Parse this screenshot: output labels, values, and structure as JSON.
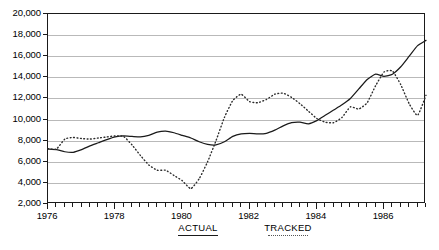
{
  "chart_data": {
    "type": "line",
    "title": "",
    "xlabel": "",
    "ylabel": "",
    "xlim": [
      1976,
      1987.25
    ],
    "ylim": [
      2000,
      20000
    ],
    "grid": true,
    "legend_position": "bottom",
    "y_ticks": [
      2000,
      4000,
      6000,
      8000,
      10000,
      12000,
      14000,
      16000,
      18000,
      20000
    ],
    "y_tick_labels": [
      "2,000",
      "4,000",
      "6,000",
      "8,000",
      "10,000",
      "12,000",
      "14,000",
      "16,000",
      "18,000",
      "20,000"
    ],
    "x_ticks": [
      1976,
      1978,
      1980,
      1982,
      1984,
      1986
    ],
    "x_tick_labels": [
      "1976",
      "1978",
      "1980",
      "1982",
      "1984",
      "1986"
    ],
    "x_minor_tick_interval": 0.25,
    "series": [
      {
        "name": "ACTUAL",
        "style": "solid",
        "color": "#1a1a1a",
        "x": [
          1976.0,
          1976.25,
          1976.5,
          1976.75,
          1977.0,
          1977.25,
          1977.5,
          1977.75,
          1978.0,
          1978.25,
          1978.5,
          1978.75,
          1979.0,
          1979.25,
          1979.5,
          1979.75,
          1980.0,
          1980.25,
          1980.5,
          1980.75,
          1981.0,
          1981.25,
          1981.5,
          1981.75,
          1982.0,
          1982.25,
          1982.5,
          1982.75,
          1983.0,
          1983.25,
          1983.5,
          1983.75,
          1984.0,
          1984.25,
          1984.5,
          1984.75,
          1985.0,
          1985.25,
          1985.5,
          1985.75,
          1986.0,
          1986.25,
          1986.5,
          1986.75,
          1987.0,
          1987.25
        ],
        "values": [
          7200,
          7150,
          6950,
          6900,
          7150,
          7500,
          7800,
          8100,
          8350,
          8450,
          8400,
          8350,
          8500,
          8800,
          8900,
          8750,
          8500,
          8250,
          7900,
          7650,
          7600,
          7900,
          8400,
          8650,
          8700,
          8650,
          8700,
          9000,
          9400,
          9700,
          9750,
          9600,
          9900,
          10400,
          10900,
          11400,
          12000,
          12900,
          13800,
          14300,
          14100,
          14300,
          15000,
          16000,
          17000,
          17500
        ]
      },
      {
        "name": "TRACKED",
        "style": "dotted",
        "color": "#2b2b2b",
        "x": [
          1976.0,
          1976.25,
          1976.5,
          1976.75,
          1977.0,
          1977.25,
          1977.5,
          1977.75,
          1978.0,
          1978.25,
          1978.5,
          1978.75,
          1979.0,
          1979.25,
          1979.5,
          1979.75,
          1980.0,
          1980.25,
          1980.5,
          1980.75,
          1981.0,
          1981.25,
          1981.5,
          1981.75,
          1982.0,
          1982.25,
          1982.5,
          1982.75,
          1983.0,
          1983.25,
          1983.5,
          1983.75,
          1984.0,
          1984.25,
          1984.5,
          1984.75,
          1985.0,
          1985.25,
          1985.5,
          1985.75,
          1986.0,
          1986.25,
          1986.5,
          1986.75,
          1987.0,
          1987.25
        ],
        "values": [
          7250,
          7200,
          8150,
          8300,
          8200,
          8150,
          8250,
          8350,
          8450,
          8400,
          7600,
          6600,
          5700,
          5200,
          5200,
          4700,
          4200,
          3450,
          4400,
          6000,
          8000,
          10200,
          11800,
          12400,
          11700,
          11600,
          11900,
          12400,
          12500,
          12100,
          11500,
          10800,
          10100,
          9750,
          9700,
          10200,
          11200,
          11000,
          11600,
          13200,
          14500,
          14600,
          13300,
          11500,
          10400,
          12300
        ]
      }
    ]
  },
  "legend": {
    "items": [
      {
        "label": "ACTUAL",
        "swatch": "solid-line-swatch"
      },
      {
        "label": "TRACKED",
        "swatch": "dotted-line-swatch"
      }
    ]
  }
}
